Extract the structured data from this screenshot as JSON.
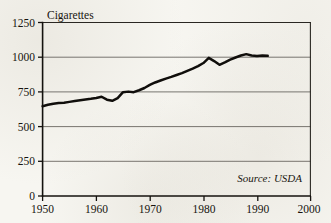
{
  "figure": {
    "background_color": "#f7f6f1",
    "ink_color": "#100e0b",
    "title": "Cigarettes",
    "source_note": "Source: USDA"
  },
  "chart_data": {
    "type": "line",
    "title": "Cigarettes",
    "subtitle": "",
    "xlabel": "",
    "ylabel": "Cigarettes",
    "xlim": [
      1950,
      2000
    ],
    "ylim": [
      0,
      1250
    ],
    "grid": true,
    "legend": "none",
    "annotations": [
      "Source: USDA"
    ],
    "x_tick_labels": [
      "1950",
      "1960",
      "1970",
      "1980",
      "1990",
      "2000"
    ],
    "x_ticks": [
      1950,
      1960,
      1970,
      1980,
      1990,
      2000
    ],
    "y_tick_labels": [
      "0",
      "250",
      "500",
      "750",
      "1000",
      "1250"
    ],
    "y_ticks": [
      0,
      250,
      500,
      750,
      1000,
      1250
    ],
    "series": [
      {
        "name": "Cigarettes per capita",
        "x": [
          1950,
          1951,
          1952,
          1953,
          1954,
          1955,
          1956,
          1957,
          1958,
          1959,
          1960,
          1961,
          1962,
          1963,
          1964,
          1965,
          1966,
          1967,
          1968,
          1969,
          1970,
          1971,
          1972,
          1973,
          1974,
          1975,
          1976,
          1977,
          1978,
          1979,
          1980,
          1981,
          1982,
          1983,
          1984,
          1985,
          1986,
          1987,
          1988,
          1989,
          1990,
          1991,
          1992
        ],
        "values": [
          647,
          657,
          665,
          670,
          672,
          678,
          684,
          690,
          695,
          700,
          706,
          715,
          694,
          686,
          705,
          748,
          752,
          748,
          762,
          778,
          800,
          818,
          832,
          846,
          858,
          872,
          885,
          902,
          918,
          936,
          958,
          995,
          972,
          945,
          962,
          982,
          998,
          1012,
          1022,
          1012,
          1008,
          1012,
          1010
        ]
      }
    ]
  }
}
